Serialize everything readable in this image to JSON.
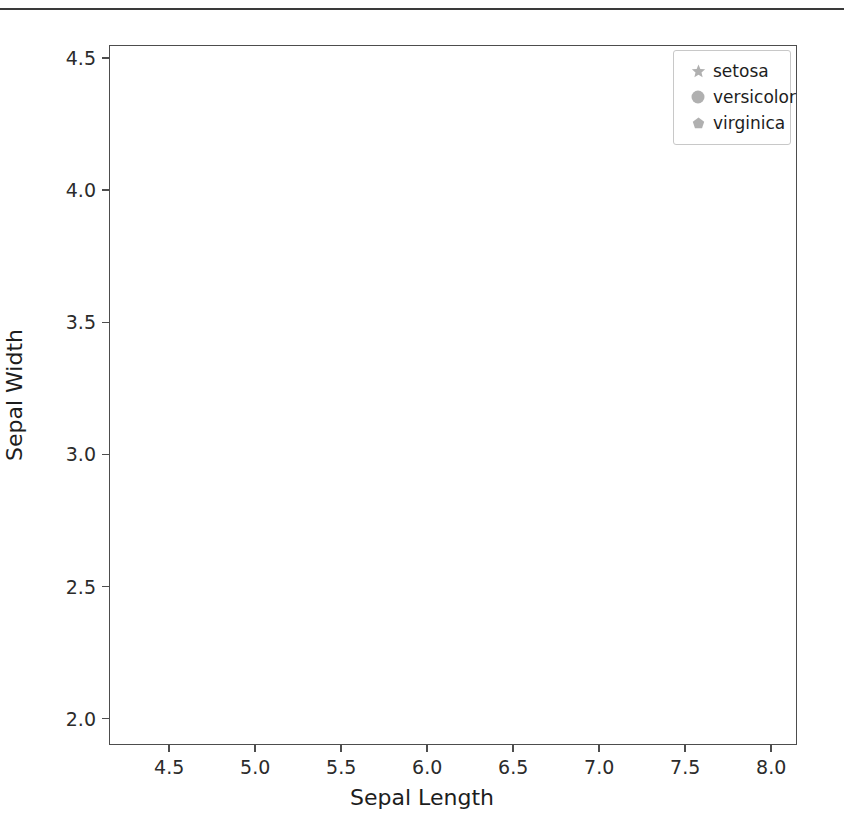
{
  "chart_data": {
    "type": "scatter",
    "title": "",
    "xlabel": "Sepal Length",
    "ylabel": "Sepal Width",
    "xlim": [
      4.15,
      8.15
    ],
    "ylim": [
      1.9,
      4.55
    ],
    "xticks": [
      "4.5",
      "5.0",
      "5.5",
      "6.0",
      "6.5",
      "7.0",
      "7.5",
      "8.0"
    ],
    "xtick_values": [
      4.5,
      5.0,
      5.5,
      6.0,
      6.5,
      7.0,
      7.5,
      8.0
    ],
    "yticks": [
      "2.0",
      "2.5",
      "3.0",
      "3.5",
      "4.0",
      "4.5"
    ],
    "ytick_values": [
      2.0,
      2.5,
      3.0,
      3.5,
      4.0,
      4.5
    ],
    "grid": false,
    "legend_position": "upper right",
    "marker_color": "#808080",
    "series": [
      {
        "name": "setosa",
        "marker": "star",
        "color": "#808080",
        "points": [
          [
            5.1,
            3.5
          ],
          [
            4.9,
            3.0
          ],
          [
            4.7,
            3.2
          ],
          [
            4.6,
            3.1
          ],
          [
            5.0,
            3.6
          ],
          [
            5.4,
            3.9
          ],
          [
            4.6,
            3.4
          ],
          [
            5.0,
            3.4
          ],
          [
            4.4,
            2.9
          ],
          [
            4.9,
            3.1
          ],
          [
            5.4,
            3.7
          ],
          [
            4.8,
            3.4
          ],
          [
            4.8,
            3.0
          ],
          [
            4.3,
            3.0
          ],
          [
            5.8,
            4.0
          ],
          [
            5.7,
            4.4
          ],
          [
            5.4,
            3.9
          ],
          [
            5.1,
            3.5
          ],
          [
            5.7,
            3.8
          ],
          [
            5.1,
            3.8
          ],
          [
            5.4,
            3.4
          ],
          [
            5.1,
            3.7
          ],
          [
            4.6,
            3.6
          ],
          [
            5.1,
            3.3
          ],
          [
            4.8,
            3.4
          ],
          [
            5.0,
            3.0
          ],
          [
            5.0,
            3.4
          ],
          [
            5.2,
            3.5
          ],
          [
            5.2,
            3.4
          ],
          [
            4.7,
            3.2
          ],
          [
            4.8,
            3.1
          ],
          [
            5.4,
            3.4
          ],
          [
            5.2,
            4.1
          ],
          [
            5.5,
            4.2
          ],
          [
            4.9,
            3.1
          ],
          [
            5.0,
            3.2
          ],
          [
            5.5,
            3.5
          ],
          [
            4.9,
            3.6
          ],
          [
            4.4,
            3.0
          ],
          [
            5.1,
            3.4
          ],
          [
            5.0,
            3.5
          ],
          [
            4.5,
            2.3
          ],
          [
            4.4,
            3.2
          ],
          [
            5.0,
            3.5
          ],
          [
            5.1,
            3.8
          ],
          [
            4.8,
            3.0
          ],
          [
            5.1,
            3.8
          ],
          [
            4.6,
            3.2
          ],
          [
            5.3,
            3.7
          ],
          [
            5.0,
            3.3
          ]
        ]
      },
      {
        "name": "versicolor",
        "marker": "circle",
        "color": "#808080",
        "points": [
          [
            7.0,
            3.2
          ],
          [
            6.4,
            3.2
          ],
          [
            6.9,
            3.1
          ],
          [
            5.5,
            2.3
          ],
          [
            6.5,
            2.8
          ],
          [
            5.7,
            2.8
          ],
          [
            6.3,
            3.3
          ],
          [
            4.9,
            2.4
          ],
          [
            6.6,
            2.9
          ],
          [
            5.2,
            2.7
          ],
          [
            5.0,
            2.0
          ],
          [
            5.9,
            3.0
          ],
          [
            6.0,
            2.2
          ],
          [
            6.1,
            2.9
          ],
          [
            5.6,
            2.9
          ],
          [
            6.7,
            3.1
          ],
          [
            5.6,
            3.0
          ],
          [
            5.8,
            2.7
          ],
          [
            6.2,
            2.2
          ],
          [
            5.6,
            2.5
          ],
          [
            5.9,
            3.2
          ],
          [
            6.1,
            2.8
          ],
          [
            6.3,
            2.5
          ],
          [
            6.1,
            2.8
          ],
          [
            6.4,
            2.9
          ],
          [
            6.6,
            3.0
          ],
          [
            6.8,
            2.8
          ],
          [
            6.7,
            3.0
          ],
          [
            6.0,
            2.9
          ],
          [
            5.7,
            2.6
          ],
          [
            5.5,
            2.4
          ],
          [
            5.5,
            2.4
          ],
          [
            5.8,
            2.7
          ],
          [
            6.0,
            2.7
          ],
          [
            5.4,
            3.0
          ],
          [
            6.0,
            3.4
          ],
          [
            6.7,
            3.1
          ],
          [
            6.3,
            2.3
          ],
          [
            5.6,
            3.0
          ],
          [
            5.5,
            2.5
          ],
          [
            5.5,
            2.6
          ],
          [
            6.1,
            3.0
          ],
          [
            5.8,
            2.6
          ],
          [
            5.0,
            2.3
          ],
          [
            5.6,
            2.7
          ],
          [
            5.7,
            3.0
          ],
          [
            5.7,
            2.9
          ],
          [
            6.2,
            2.9
          ],
          [
            5.1,
            2.5
          ],
          [
            5.7,
            2.8
          ]
        ]
      },
      {
        "name": "virginica",
        "marker": "pentagon",
        "color": "#808080",
        "points": [
          [
            6.3,
            3.3
          ],
          [
            5.8,
            2.7
          ],
          [
            7.1,
            3.0
          ],
          [
            6.3,
            2.9
          ],
          [
            6.5,
            3.0
          ],
          [
            7.6,
            3.0
          ],
          [
            4.9,
            2.5
          ],
          [
            7.3,
            2.9
          ],
          [
            6.7,
            2.5
          ],
          [
            7.2,
            3.6
          ],
          [
            6.5,
            3.2
          ],
          [
            6.4,
            2.7
          ],
          [
            6.8,
            3.0
          ],
          [
            5.7,
            2.5
          ],
          [
            5.8,
            2.8
          ],
          [
            6.4,
            3.2
          ],
          [
            6.5,
            3.0
          ],
          [
            7.7,
            3.8
          ],
          [
            7.7,
            2.6
          ],
          [
            6.0,
            2.2
          ],
          [
            6.9,
            3.2
          ],
          [
            5.6,
            2.8
          ],
          [
            7.7,
            2.8
          ],
          [
            6.3,
            2.7
          ],
          [
            6.7,
            3.3
          ],
          [
            7.2,
            3.2
          ],
          [
            6.2,
            2.8
          ],
          [
            6.1,
            3.0
          ],
          [
            6.4,
            2.8
          ],
          [
            7.2,
            3.0
          ],
          [
            7.4,
            2.8
          ],
          [
            7.9,
            3.8
          ],
          [
            6.4,
            2.8
          ],
          [
            6.3,
            2.8
          ],
          [
            6.1,
            2.6
          ],
          [
            7.7,
            3.0
          ],
          [
            6.3,
            3.4
          ],
          [
            6.4,
            3.1
          ],
          [
            6.0,
            3.0
          ],
          [
            6.9,
            3.1
          ],
          [
            6.7,
            3.1
          ],
          [
            6.9,
            3.1
          ],
          [
            5.8,
            2.7
          ],
          [
            6.8,
            3.2
          ],
          [
            6.7,
            3.3
          ],
          [
            6.7,
            3.0
          ],
          [
            6.3,
            2.5
          ],
          [
            6.5,
            3.0
          ],
          [
            6.2,
            3.4
          ],
          [
            5.9,
            3.0
          ]
        ]
      }
    ]
  },
  "legend": {
    "items": [
      {
        "label": "setosa",
        "marker": "star-marker"
      },
      {
        "label": "versicolor",
        "marker": "circle-marker"
      },
      {
        "label": "virginica",
        "marker": "pentagon-marker"
      }
    ]
  }
}
